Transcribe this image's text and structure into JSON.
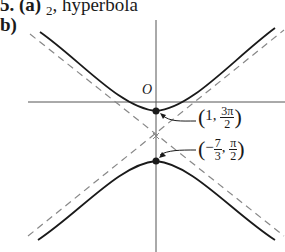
{
  "header": {
    "problem_number": "5.",
    "part_a_label": "(a)",
    "part_a_value_sub": "2",
    "part_a_text": ", hyperbola",
    "part_b_label": "b)"
  },
  "figure": {
    "origin_label": "O",
    "point1": {
      "open": "(",
      "x": "1,",
      "y_num": "3π",
      "y_den": "2",
      "close": ")"
    },
    "point2": {
      "open": "(",
      "x_sign": "−",
      "x_num": "7",
      "x_den": "3",
      "sep": ",",
      "y_num": "π",
      "y_den": "2",
      "close": ")"
    },
    "colors": {
      "curve": "#1a1a1a",
      "axis": "#444444",
      "asymptote": "#888888"
    }
  }
}
